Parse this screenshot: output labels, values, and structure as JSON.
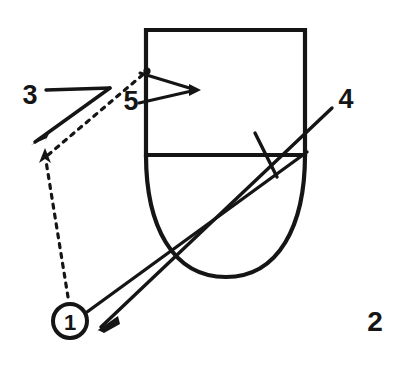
{
  "figure": {
    "figure_number": "2",
    "background_color": "#ffffff",
    "ink_color": "#151515",
    "canvas": {
      "width": 394,
      "height": 366
    },
    "reference_labels": [
      {
        "id": "label-3",
        "text": "3",
        "x": 30,
        "y": 95,
        "font_size": 27,
        "leader": "solid-bent"
      },
      {
        "id": "label-5",
        "text": "5",
        "x": 131,
        "y": 101,
        "font_size": 27,
        "leader": "solid-open-triangle"
      },
      {
        "id": "label-4",
        "text": "4",
        "x": 346,
        "y": 99,
        "font_size": 27,
        "leader": "solid-long-diagonal"
      },
      {
        "id": "label-1",
        "text": "1",
        "x": 70,
        "y": 321,
        "font_size": 22,
        "leader": "dashed-bent",
        "circled": true
      }
    ],
    "figure_caption": {
      "id": "figure-number",
      "text": "2",
      "x": 375,
      "y": 321,
      "font_size": 28
    },
    "geometry": {
      "body_rectangle": {
        "left": 146,
        "top": 30,
        "right": 305,
        "bottom": 155
      },
      "divider_line_y": 155,
      "rounded_tip_bottom_y": 277,
      "callout_circle": {
        "cx": 70,
        "cy": 321,
        "r": 17
      },
      "tick_mark": {
        "x1": 255,
        "y1": 133,
        "x2": 277,
        "y2": 177
      }
    }
  }
}
